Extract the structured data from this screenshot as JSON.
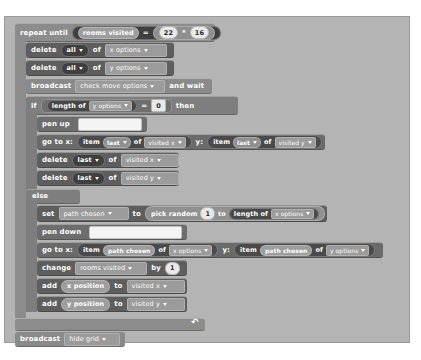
{
  "canvas": {
    "background_color": "#b4b4b4",
    "page_background": "#ffffff"
  },
  "script": {
    "title": "maze-backtracking-script",
    "blocks": [
      {
        "id": "repeat-until",
        "type": "control-c",
        "label": "repeat until",
        "condition": {
          "left": "rooms visited",
          "operator": "=",
          "right_left": "22",
          "right_operator": "*",
          "right_right": "16"
        }
      },
      {
        "id": "delete-x-options",
        "type": "data",
        "label": "delete",
        "index_value": "all",
        "of_label": "of",
        "list_name": "x options"
      },
      {
        "id": "delete-y-options",
        "type": "data",
        "label": "delete",
        "index_value": "all",
        "of_label": "of",
        "list_name": "y options"
      },
      {
        "id": "broadcast-check-move-options",
        "type": "events",
        "label": "broadcast",
        "message": "check move options",
        "suffix": "and wait"
      },
      {
        "id": "if-else",
        "type": "control-c",
        "label": "if",
        "then_label": "then",
        "else_label": "else",
        "condition": {
          "reporter_label": "length of",
          "reporter_list": "y options",
          "operator": "=",
          "value": "0"
        }
      },
      {
        "id": "pen-up",
        "type": "pen",
        "label": "pen up"
      },
      {
        "id": "go-to-last-visited",
        "type": "motion",
        "label": "go to x:",
        "x_item_label": "item",
        "x_index": "last",
        "x_of": "of",
        "x_list": "visited x",
        "y_label": "y:",
        "y_item_label": "item",
        "y_index": "last",
        "y_of": "of",
        "y_list": "visited y"
      },
      {
        "id": "delete-last-visited-x",
        "type": "data",
        "label": "delete",
        "index_value": "last",
        "of_label": "of",
        "list_name": "visited x"
      },
      {
        "id": "delete-last-visited-y",
        "type": "data",
        "label": "delete",
        "index_value": "last",
        "of_label": "of",
        "list_name": "visited y"
      },
      {
        "id": "set-path-chosen",
        "type": "data",
        "label": "set",
        "variable": "path chosen",
        "to_label": "to",
        "pick_random_label": "pick random",
        "from_value": "1",
        "to_value_label": "to",
        "length_label": "length of",
        "length_list": "x options"
      },
      {
        "id": "pen-down",
        "type": "pen",
        "label": "pen down"
      },
      {
        "id": "go-to-path-chosen",
        "type": "motion",
        "label": "go to x:",
        "x_item_label": "item",
        "x_index": "path chosen",
        "x_of": "of",
        "x_list": "x options",
        "y_label": "y:",
        "y_item_label": "item",
        "y_index": "path chosen",
        "y_of": "of",
        "y_list": "y options"
      },
      {
        "id": "change-rooms-visited",
        "type": "data",
        "label": "change",
        "variable": "rooms visited",
        "by_label": "by",
        "amount": "1"
      },
      {
        "id": "add-x-position",
        "type": "data",
        "label": "add",
        "value": "x position",
        "to_label": "to",
        "list_name": "visited x"
      },
      {
        "id": "add-y-position",
        "type": "data",
        "label": "add",
        "value": "y position",
        "to_label": "to",
        "list_name": "visited y"
      },
      {
        "id": "broadcast-hide-grid",
        "type": "events",
        "label": "broadcast",
        "message": "hide grid"
      }
    ]
  },
  "colors": {
    "control": "#8c8c8c",
    "control_dark": "#7e7e7e",
    "events": "#8a8a8a",
    "pen": "#6d6d6d",
    "data": "#5e5e5e",
    "motion": "#6a6a6a",
    "reporter_dark": "#3f3f3f",
    "input_light": "#e9e9e9"
  },
  "icons": {
    "dropdown": "chevron-down-icon",
    "loop": "loop-arrow-icon"
  }
}
